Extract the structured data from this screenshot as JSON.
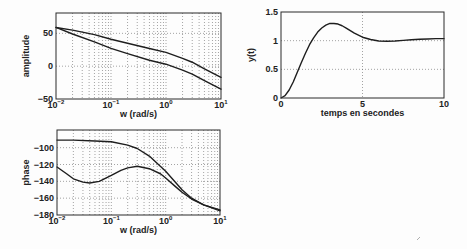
{
  "chart_data": [
    {
      "id": "amplitude",
      "type": "line",
      "title": "",
      "xlabel": "w (rad/s)",
      "ylabel": "amplitude",
      "xscale": "log",
      "xlim": [
        0.01,
        10
      ],
      "ylim": [
        -50,
        81
      ],
      "grid": {
        "x": "log-minor",
        "y": [
          0,
          50
        ]
      },
      "xticks": [
        {
          "v": 0.01,
          "label": "10",
          "exp": "−2"
        },
        {
          "v": 0.1,
          "label": "10",
          "exp": "−1"
        },
        {
          "v": 1,
          "label": "10",
          "exp": "0"
        },
        {
          "v": 10,
          "label": "10",
          "exp": "1"
        }
      ],
      "yticks": [
        {
          "v": 50,
          "label": "50"
        },
        {
          "v": 0,
          "label": "0"
        },
        {
          "v": -50,
          "label": "−50"
        }
      ],
      "series": [
        {
          "name": "amplitude-curve-upper",
          "x": [
            0.01,
            0.02,
            0.05,
            0.1,
            0.2,
            0.5,
            1,
            2,
            3,
            5,
            10
          ],
          "y": [
            59,
            55,
            48,
            41,
            35,
            27,
            21,
            12,
            6,
            -4,
            -17
          ]
        },
        {
          "name": "amplitude-curve-lower",
          "x": [
            0.01,
            0.02,
            0.05,
            0.1,
            0.2,
            0.5,
            1,
            2,
            3,
            5,
            10
          ],
          "y": [
            59,
            49,
            37,
            27,
            19,
            9,
            3,
            -6,
            -12,
            -22,
            -35
          ]
        }
      ]
    },
    {
      "id": "phase",
      "type": "line",
      "title": "",
      "xlabel": "w (rad/s)",
      "ylabel": "phase",
      "xscale": "log",
      "xlim": [
        0.01,
        10
      ],
      "ylim": [
        -180,
        -79
      ],
      "grid": {
        "x": "log-minor",
        "y": [
          -100,
          -120,
          -140,
          -160
        ]
      },
      "xticks": [
        {
          "v": 0.01,
          "label": "10",
          "exp": "−2"
        },
        {
          "v": 0.1,
          "label": "10",
          "exp": "−1"
        },
        {
          "v": 1,
          "label": "10",
          "exp": "0"
        },
        {
          "v": 10,
          "label": "10",
          "exp": "1"
        }
      ],
      "yticks": [
        {
          "v": -100,
          "label": "−100"
        },
        {
          "v": -120,
          "label": "−120"
        },
        {
          "v": -140,
          "label": "−140"
        },
        {
          "v": -160,
          "label": "−160"
        },
        {
          "v": -180,
          "label": "−180"
        }
      ],
      "series": [
        {
          "name": "phase-curve-upper",
          "x": [
            0.01,
            0.02,
            0.05,
            0.1,
            0.2,
            0.3,
            0.5,
            1,
            2,
            3,
            5,
            10
          ],
          "y": [
            -91,
            -91,
            -92,
            -93,
            -97,
            -101,
            -110,
            -128,
            -150,
            -160,
            -168,
            -174
          ]
        },
        {
          "name": "phase-curve-lower",
          "x": [
            0.01,
            0.015,
            0.02,
            0.03,
            0.04,
            0.06,
            0.1,
            0.15,
            0.2,
            0.3,
            0.5,
            0.8,
            1,
            1.5,
            2,
            3,
            5,
            10
          ],
          "y": [
            -123,
            -131,
            -137,
            -141,
            -142,
            -140,
            -133,
            -127,
            -124,
            -122,
            -125,
            -131,
            -136,
            -146,
            -153,
            -161,
            -168,
            -175
          ]
        }
      ]
    },
    {
      "id": "step-response",
      "type": "line",
      "title": "",
      "xlabel": "temps en secondes",
      "ylabel": "y(t)",
      "xscale": "linear",
      "xlim": [
        0,
        10
      ],
      "ylim": [
        0,
        1.5
      ],
      "grid": {
        "x": [
          5
        ],
        "y": [
          0.5,
          1
        ]
      },
      "xticks": [
        {
          "v": 0,
          "label": "0"
        },
        {
          "v": 5,
          "label": "5"
        },
        {
          "v": 10,
          "label": "10"
        }
      ],
      "yticks": [
        {
          "v": 1.5,
          "label": "1.5"
        },
        {
          "v": 1,
          "label": "1"
        },
        {
          "v": 0.5,
          "label": "0.5"
        },
        {
          "v": 0,
          "label": "0"
        }
      ],
      "series": [
        {
          "name": "step-response-curve",
          "x": [
            0,
            0.25,
            0.5,
            0.75,
            1,
            1.25,
            1.5,
            1.75,
            2,
            2.25,
            2.5,
            2.75,
            3,
            3.25,
            3.5,
            3.75,
            4,
            4.5,
            5,
            5.5,
            6,
            6.5,
            7,
            7.5,
            8,
            8.5,
            9,
            9.5,
            10
          ],
          "y": [
            0,
            0.04,
            0.14,
            0.28,
            0.45,
            0.62,
            0.78,
            0.93,
            1.05,
            1.15,
            1.22,
            1.27,
            1.3,
            1.3,
            1.29,
            1.26,
            1.22,
            1.13,
            1.06,
            1.02,
            0.995,
            0.99,
            0.995,
            1.005,
            1.015,
            1.025,
            1.03,
            1.035,
            1.035
          ]
        }
      ]
    }
  ]
}
